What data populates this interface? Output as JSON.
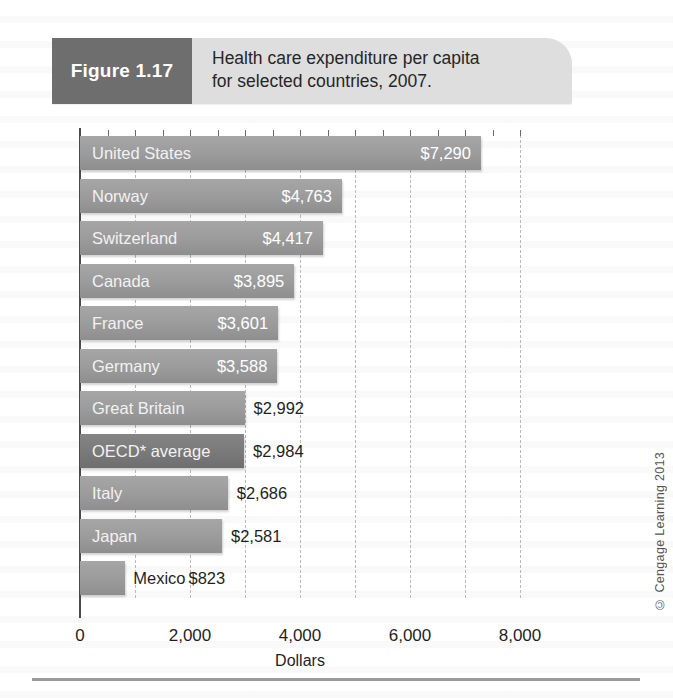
{
  "figure": {
    "tag": "Figure 1.17",
    "caption": "Health care expenditure per capita\nfor selected countries, 2007."
  },
  "credit": "© Cengage Learning 2013",
  "colors": {
    "bar": "#9b9b9b",
    "bar_highlight": "#797979",
    "tag_background": "#6e6e6e",
    "header_background": "#dedede",
    "gridline": "#b9b9b9",
    "axis": "#4a4a4a"
  },
  "chart_data": {
    "type": "bar",
    "orientation": "horizontal",
    "title": "Health care expenditure per capita for selected countries, 2007.",
    "xlabel": "Dollars",
    "ylabel": "",
    "xlim": [
      0,
      8000
    ],
    "xticks": [
      "0",
      "2,000",
      "4,000",
      "6,000",
      "8,000"
    ],
    "xtick_values": [
      0,
      2000,
      4000,
      6000,
      8000
    ],
    "grid": "vertical-dashed",
    "legend": "none",
    "categories": [
      "United States",
      "Norway",
      "Switzerland",
      "Canada",
      "France",
      "Germany",
      "Great Britain",
      "OECD* average",
      "Italy",
      "Japan",
      "Mexico"
    ],
    "values": [
      7290,
      4763,
      4417,
      3895,
      3601,
      3588,
      2992,
      2984,
      2686,
      2581,
      823
    ],
    "value_labels": [
      "$7,290",
      "$4,763",
      "$4,417",
      "$3,895",
      "$3,601",
      "$3,588",
      "$2,992",
      "$2,984",
      "$2,686",
      "$2,581",
      "$823"
    ],
    "label_placement": [
      "inside",
      "inside",
      "inside",
      "inside",
      "inside",
      "inside",
      "outside",
      "outside",
      "outside",
      "outside",
      "outside"
    ],
    "category_placement": [
      "inside",
      "inside",
      "inside",
      "inside",
      "inside",
      "inside",
      "inside",
      "inside",
      "inside",
      "inside",
      "outside"
    ],
    "highlighted": [
      "OECD* average"
    ]
  }
}
